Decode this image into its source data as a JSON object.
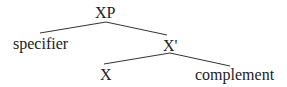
{
  "diagram": {
    "type": "syntax-tree",
    "nodes": {
      "root": "XP",
      "specifier": "specifier",
      "bar": "X'",
      "head": "X",
      "complement": "complement"
    },
    "edges": [
      [
        "XP",
        "specifier"
      ],
      [
        "XP",
        "X'"
      ],
      [
        "X'",
        "X"
      ],
      [
        "X'",
        "complement"
      ]
    ]
  }
}
